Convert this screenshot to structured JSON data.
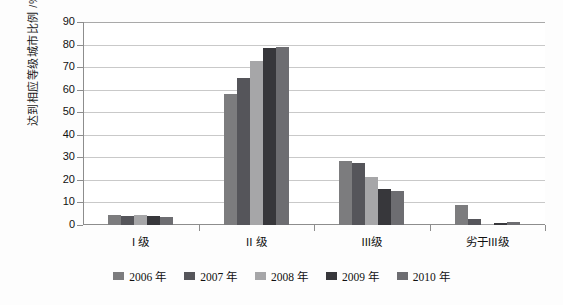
{
  "chart_data": {
    "type": "bar",
    "title": "",
    "xlabel": "",
    "ylabel": "达到相应等级城市比例 /%",
    "ylim": [
      0,
      90
    ],
    "ytick_step": 10,
    "yticks": [
      90,
      80,
      70,
      60,
      50,
      40,
      30,
      20,
      10,
      0
    ],
    "grid": true,
    "legend_position": "bottom",
    "categories": [
      "I 级",
      "II 级",
      "III级",
      "劣于III级"
    ],
    "series": [
      {
        "name": "2006 年",
        "color": "#7c7c7e",
        "values": [
          4.3,
          58.0,
          28.5,
          9.0
        ]
      },
      {
        "name": "2007 年",
        "color": "#55555a",
        "values": [
          4.2,
          65.0,
          27.5,
          2.5
        ]
      },
      {
        "name": "2008 年",
        "color": "#a6a6a8",
        "values": [
          4.3,
          72.5,
          21.5,
          0.6
        ]
      },
      {
        "name": "2009 年",
        "color": "#37373b",
        "values": [
          4.1,
          78.3,
          16.0,
          1.0
        ]
      },
      {
        "name": "2010 年",
        "color": "#6d6d71",
        "values": [
          3.5,
          79.0,
          15.0,
          1.4
        ]
      }
    ]
  },
  "legend": {
    "items": [
      {
        "label": "2006 年"
      },
      {
        "label": "2007 年"
      },
      {
        "label": "2008 年"
      },
      {
        "label": "2009 年"
      },
      {
        "label": "2010 年"
      }
    ]
  }
}
